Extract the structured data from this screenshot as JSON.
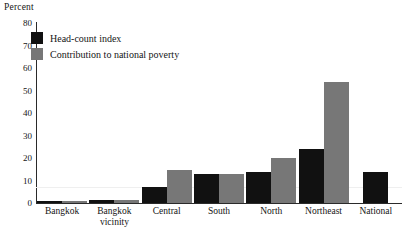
{
  "chart_data": {
    "type": "bar",
    "title": "",
    "ylabel": "Percent",
    "xlabel": "",
    "ylim": [
      0,
      80
    ],
    "ytick_step": 10,
    "grid": false,
    "legend_position": "top-left",
    "categories": [
      "Bangkok",
      "Bangkok vicinity",
      "Central",
      "South",
      "North",
      "Northeast",
      "National"
    ],
    "category_lines": [
      [
        "Bangkok",
        ""
      ],
      [
        "Bangkok",
        "vicinity"
      ],
      [
        "Central",
        ""
      ],
      [
        "South",
        ""
      ],
      [
        "North",
        ""
      ],
      [
        "Northeast",
        ""
      ],
      [
        "National",
        ""
      ]
    ],
    "yticks": [
      "80",
      "70",
      "60",
      "50",
      "40",
      "30",
      "20",
      "10",
      "0"
    ],
    "series": [
      {
        "name": "Head-count index",
        "color": "#111111",
        "values": [
          1,
          1.5,
          7,
          13,
          14,
          24,
          14
        ]
      },
      {
        "name": "Contribution to national poverty",
        "color": "#777777",
        "values": [
          1,
          1.5,
          14.5,
          13,
          20,
          54,
          0
        ]
      }
    ]
  },
  "legend": {
    "items": [
      {
        "label": "Head-count index",
        "color": "#111111"
      },
      {
        "label": "Contribution to national poverty",
        "color": "#777777"
      }
    ]
  }
}
